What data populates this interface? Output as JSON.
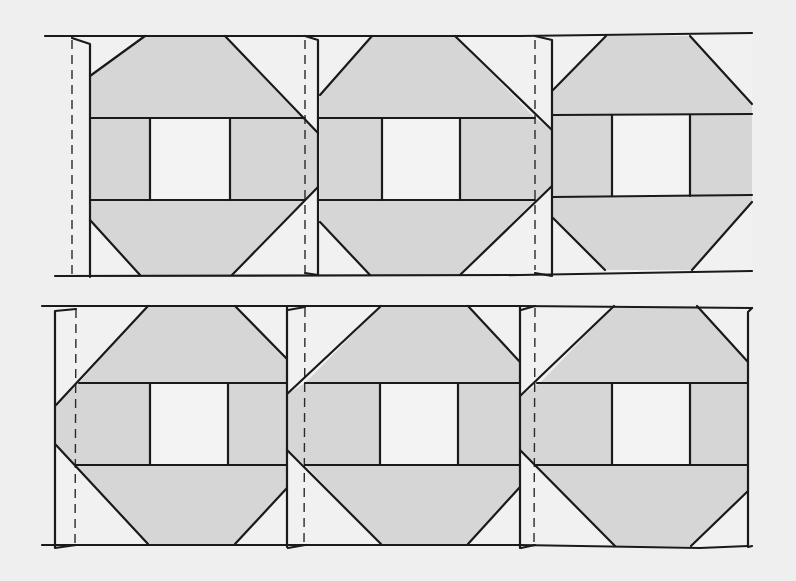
{
  "diagram": {
    "title": "",
    "colors": {
      "background": "#efefef",
      "shaded_fabric": "#d6d6d6",
      "light_fabric": "#f1f1f1",
      "center_square": "#f3f3f3",
      "line": "#1a1a1a"
    },
    "rows": [
      {
        "name": "top-row",
        "top": 36,
        "bottom": 275,
        "band_top": 118,
        "band_bottom": 200,
        "outline_left": 45,
        "outline_right": 752,
        "blocks": [
          {
            "name": "block-1",
            "left": 90,
            "right": 318,
            "center_left": 150,
            "center_right": 230,
            "flap_left": 70,
            "seam_x": 72,
            "top_trap": [
              [
                90,
                118
              ],
              [
                90,
                76
              ],
              [
                145,
                36
              ],
              [
                225,
                36
              ],
              [
                318,
                133
              ],
              [
                318,
                118
              ]
            ],
            "bot_trap": [
              [
                90,
                200
              ],
              [
                90,
                220
              ],
              [
                140,
                275
              ],
              [
                232,
                275
              ],
              [
                318,
                187
              ],
              [
                318,
                200
              ]
            ]
          },
          {
            "name": "block-2",
            "left": 320,
            "right": 552,
            "center_left": 382,
            "center_right": 460,
            "flap_left": 305,
            "seam_x": 305,
            "top_trap": [
              [
                320,
                118
              ],
              [
                320,
                95
              ],
              [
                372,
                36
              ],
              [
                455,
                36
              ],
              [
                552,
                130
              ],
              [
                552,
                118
              ]
            ],
            "bot_trap": [
              [
                320,
                200
              ],
              [
                320,
                222
              ],
              [
                370,
                275
              ],
              [
                460,
                275
              ],
              [
                552,
                186
              ],
              [
                552,
                200
              ]
            ]
          },
          {
            "name": "block-3",
            "left": 553,
            "right": 752,
            "center_left": 612,
            "center_right": 690,
            "flap_left": 534,
            "seam_x": 535,
            "top_trap": [
              [
                553,
                115
              ],
              [
                553,
                90
              ],
              [
                606,
                36
              ],
              [
                690,
                36
              ],
              [
                752,
                104
              ],
              [
                752,
                115
              ]
            ],
            "bot_trap": [
              [
                553,
                196
              ],
              [
                553,
                218
              ],
              [
                605,
                270
              ],
              [
                692,
                270
              ],
              [
                752,
                202
              ],
              [
                752,
                196
              ]
            ]
          }
        ]
      },
      {
        "name": "bottom-row",
        "top": 306,
        "bottom": 546,
        "band_top": 383,
        "band_bottom": 465,
        "outline_left": 42,
        "outline_right": 750,
        "blocks": [
          {
            "name": "block-1",
            "left": 55,
            "right": 287,
            "center_left": 150,
            "center_right": 228,
            "flap_left": 55,
            "seam_x": 76,
            "top_trap": [
              [
                79,
                383
              ],
              [
                148,
                306
              ],
              [
                235,
                306
              ],
              [
                287,
                359
              ],
              [
                287,
                383
              ]
            ],
            "bot_trap": [
              [
                75,
                465
              ],
              [
                148,
                544
              ],
              [
                235,
                544
              ],
              [
                287,
                488
              ],
              [
                287,
                465
              ]
            ],
            "left_wedge": [
              [
                58,
                405
              ],
              [
                79,
                383
              ],
              [
                58,
                383
              ]
            ]
          },
          {
            "name": "block-2",
            "left": 287,
            "right": 520,
            "center_left": 380,
            "center_right": 458,
            "flap_left": 287,
            "seam_x": 305,
            "top_trap": [
              [
                305,
                383
              ],
              [
                381,
                306
              ],
              [
                468,
                306
              ],
              [
                520,
                362
              ],
              [
                520,
                383
              ]
            ],
            "bot_trap": [
              [
                305,
                465
              ],
              [
                381,
                544
              ],
              [
                468,
                544
              ],
              [
                520,
                487
              ],
              [
                520,
                465
              ]
            ]
          },
          {
            "name": "block-3",
            "left": 520,
            "right": 748,
            "center_left": 612,
            "center_right": 690,
            "flap_left": 520,
            "seam_x": 535,
            "top_trap": [
              [
                540,
                383
              ],
              [
                614,
                306
              ],
              [
                697,
                306
              ],
              [
                748,
                362
              ],
              [
                748,
                383
              ]
            ],
            "bot_trap": [
              [
                535,
                465
              ],
              [
                615,
                546
              ],
              [
                691,
                546
              ],
              [
                748,
                491
              ],
              [
                748,
                465
              ]
            ]
          }
        ]
      }
    ]
  }
}
